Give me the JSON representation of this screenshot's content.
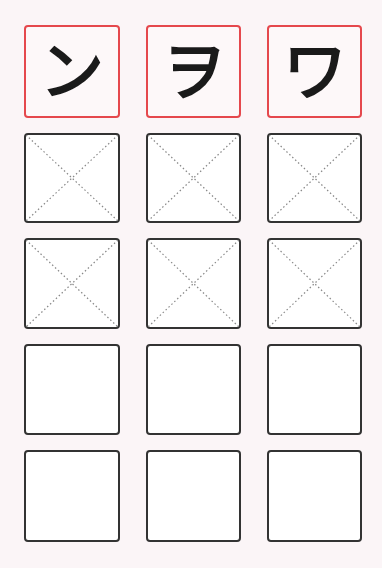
{
  "worksheet": {
    "columns": [
      {
        "character": "ン",
        "reading": "n"
      },
      {
        "character": "ヲ",
        "reading": "wo"
      },
      {
        "character": "ワ",
        "reading": "wa"
      }
    ],
    "rows": [
      {
        "type": "model"
      },
      {
        "type": "guided"
      },
      {
        "type": "guided"
      },
      {
        "type": "blank"
      },
      {
        "type": "blank"
      }
    ],
    "colors": {
      "background": "#fbf5f7",
      "model_border": "#e5484d",
      "practice_border": "#333333",
      "guide_line": "#888888",
      "glyph": "#1a1a1a"
    }
  }
}
